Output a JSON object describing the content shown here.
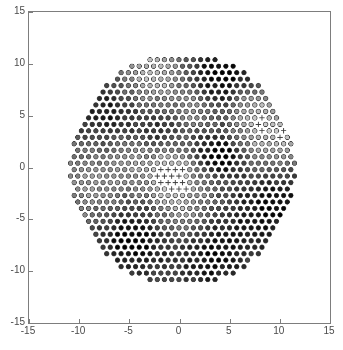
{
  "figure": {
    "background_color": "#ffffff",
    "axis_color": "#7d7d7d",
    "tick_label_color": "#4a4a4a",
    "width": 343,
    "height": 350
  },
  "chart_data": {
    "type": "scatter",
    "title": "",
    "xlabel": "",
    "ylabel": "",
    "xlim": [
      -15,
      15
    ],
    "ylim": [
      -15,
      15
    ],
    "xticks": [
      -15,
      -10,
      -5,
      0,
      5,
      10,
      15
    ],
    "yticks": [
      -15,
      -10,
      -5,
      0,
      5,
      10,
      15
    ],
    "xticklabels": [
      "-15",
      "-10",
      "-5",
      "0",
      "5",
      "10",
      "15"
    ],
    "yticklabels": [
      "-15",
      "-10",
      "-5",
      "0",
      "5",
      "10",
      "15"
    ],
    "grid": false,
    "legend": null,
    "annotations": [],
    "layout": {
      "lattice": "hexagonal",
      "spacing": 0.72,
      "disk_center": [
        0.3,
        -0.2
      ],
      "disk_radius": 11.2,
      "marker_size_px": 4.6,
      "circle_marker": "o",
      "plus_marker": "+"
    },
    "colormap": {
      "name": "gray",
      "stops": [
        "#000000",
        "#2a2a2a",
        "#555555",
        "#808080",
        "#aaaaaa",
        "#d5d5d5",
        "#ffffff"
      ]
    },
    "value_range": [
      0,
      1
    ],
    "field": {
      "note": "Scalar field sampled on the hex lattice; composed of smooth radial background plus localized lobes",
      "base_level": 0.52,
      "radial_falloff": -0.12,
      "lobes": [
        {
          "cx": 4.2,
          "cy": 8.4,
          "r": 4.2,
          "amp": -0.45
        },
        {
          "cx": 9.4,
          "cy": 3.2,
          "r": 3.6,
          "amp": 0.4
        },
        {
          "cx": 9.0,
          "cy": -3.6,
          "r": 4.4,
          "amp": -0.4
        },
        {
          "cx": 3.2,
          "cy": -8.4,
          "r": 4.0,
          "amp": -0.38
        },
        {
          "cx": -4.6,
          "cy": -6.8,
          "r": 3.8,
          "amp": -0.46
        },
        {
          "cx": -8.6,
          "cy": -1.2,
          "r": 4.0,
          "amp": 0.22
        },
        {
          "cx": -7.0,
          "cy": 5.2,
          "r": 4.2,
          "amp": -0.34
        },
        {
          "cx": -2.6,
          "cy": 9.0,
          "r": 3.6,
          "amp": 0.4
        },
        {
          "cx": -1.0,
          "cy": -0.8,
          "r": 2.6,
          "amp": 0.42
        },
        {
          "cx": 2.6,
          "cy": 1.6,
          "r": 2.2,
          "amp": -0.3
        },
        {
          "cx": 4.6,
          "cy": 1.0,
          "r": 1.9,
          "amp": -0.42
        },
        {
          "cx": -1.8,
          "cy": 3.6,
          "r": 2.4,
          "amp": -0.26
        },
        {
          "cx": 1.6,
          "cy": 5.6,
          "r": 2.0,
          "amp": 0.3
        },
        {
          "cx": 6.6,
          "cy": 6.0,
          "r": 2.2,
          "amp": 0.34
        },
        {
          "cx": -5.0,
          "cy": 1.4,
          "r": 2.0,
          "amp": 0.18
        },
        {
          "cx": 0.2,
          "cy": -4.6,
          "r": 2.6,
          "amp": 0.24
        }
      ]
    }
  }
}
